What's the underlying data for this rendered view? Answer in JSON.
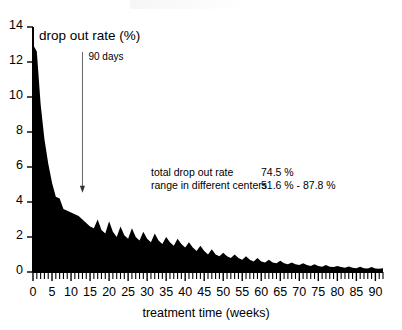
{
  "chart_data": {
    "type": "area",
    "title": "drop out rate  (%)",
    "xlabel": "treatment time  (weeks)",
    "ylabel": "drop out rate (%)",
    "xlim": [
      0,
      92
    ],
    "ylim": [
      0,
      14
    ],
    "grid": false,
    "legend": "none",
    "x_ticks": [
      0,
      5,
      10,
      15,
      20,
      25,
      30,
      35,
      40,
      45,
      50,
      55,
      60,
      65,
      70,
      75,
      80,
      85,
      90
    ],
    "x_tick_labels": [
      "0",
      "5",
      "10",
      "15",
      "20",
      "25",
      "30",
      "35",
      "40",
      "45",
      "50",
      "55",
      "60",
      "65",
      "70",
      "75",
      "80",
      "85",
      "90"
    ],
    "x_minor_tick_step": 1,
    "y_ticks": [
      0,
      2,
      4,
      6,
      8,
      10,
      12,
      14
    ],
    "y_tick_labels": [
      "0",
      "2",
      "4",
      "6",
      "8",
      "10",
      "12",
      "14"
    ],
    "series": [
      {
        "name": "drop out rate",
        "x": [
          0,
          1,
          2,
          3,
          4,
          5,
          6,
          7,
          8,
          9,
          10,
          11,
          12,
          13,
          14,
          15,
          16,
          17,
          18,
          19,
          20,
          21,
          22,
          23,
          24,
          25,
          26,
          27,
          28,
          29,
          30,
          31,
          32,
          33,
          34,
          35,
          36,
          37,
          38,
          39,
          40,
          41,
          42,
          43,
          44,
          45,
          46,
          47,
          48,
          49,
          50,
          51,
          52,
          53,
          54,
          55,
          56,
          57,
          58,
          59,
          60,
          61,
          62,
          63,
          64,
          65,
          66,
          67,
          68,
          69,
          70,
          71,
          72,
          73,
          74,
          75,
          76,
          77,
          78,
          79,
          80,
          81,
          82,
          83,
          84,
          85,
          86,
          87,
          88,
          89,
          90,
          91,
          92
        ],
        "values": [
          13.0,
          12.6,
          9.6,
          7.6,
          6.2,
          5.1,
          4.3,
          4.2,
          3.6,
          3.5,
          3.4,
          3.3,
          3.2,
          3.0,
          2.8,
          2.6,
          2.5,
          3.0,
          2.4,
          2.2,
          2.9,
          2.3,
          2.0,
          2.6,
          2.1,
          1.9,
          2.5,
          2.0,
          1.8,
          2.3,
          1.9,
          1.7,
          2.2,
          1.8,
          1.6,
          2.0,
          1.7,
          1.5,
          1.9,
          1.6,
          1.4,
          1.7,
          1.4,
          1.2,
          1.5,
          1.2,
          1.0,
          1.3,
          1.0,
          0.9,
          1.1,
          0.9,
          0.8,
          1.0,
          0.8,
          0.7,
          0.9,
          0.7,
          0.6,
          0.8,
          0.6,
          0.55,
          0.7,
          0.55,
          0.5,
          0.65,
          0.5,
          0.45,
          0.55,
          0.45,
          0.4,
          0.5,
          0.4,
          0.35,
          0.45,
          0.35,
          0.3,
          0.4,
          0.3,
          0.28,
          0.35,
          0.28,
          0.25,
          0.32,
          0.25,
          0.22,
          0.3,
          0.22,
          0.2,
          0.28,
          0.2,
          0.18,
          0.22
        ]
      }
    ],
    "annotations": [
      {
        "name": "ninety-days-marker",
        "text": "90 days",
        "x_week": 13,
        "y_top": 14,
        "y_bottom": 4.3
      }
    ],
    "stats": [
      {
        "label": "total drop out rate",
        "value": "74.5 %"
      },
      {
        "label": "range in different centers",
        "value": "51.6 % - 87.8 %"
      }
    ]
  }
}
